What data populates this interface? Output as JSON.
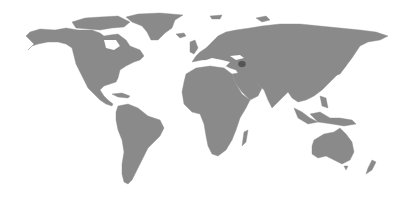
{
  "map": {
    "type": "world-choropleth",
    "projection": "equirectangular-like",
    "colors": {
      "background": "#ffffff",
      "land": "#8a8a8a",
      "highlight": "#555555"
    },
    "highlighted_regions": [
      {
        "name": "Armenia",
        "approx_center_px": [
          242,
          64
        ]
      }
    ],
    "landmasses": [
      "North America",
      "Greenland",
      "South America",
      "Europe",
      "Africa",
      "Madagascar",
      "Asia",
      "Japan",
      "Southeast Asia",
      "Australia",
      "New Zealand",
      "Antarctic/Arctic islands"
    ],
    "highlight_label": "Armenia"
  }
}
